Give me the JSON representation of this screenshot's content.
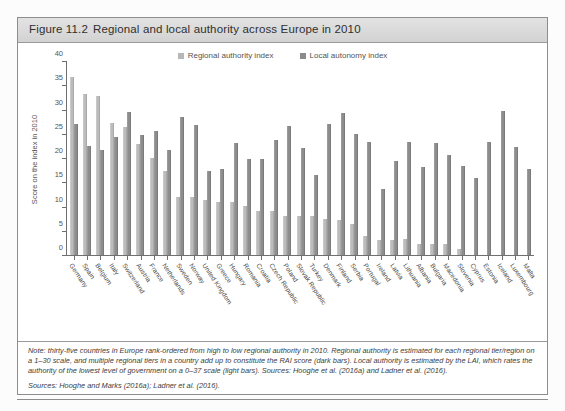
{
  "figure": {
    "number": "Figure 11.2",
    "title": "Regional and local authority across Europe in 2010"
  },
  "legend": {
    "items": [
      {
        "label": "Regional authority index",
        "color": "#b7b7b7",
        "key": "rai"
      },
      {
        "label": "Local autonomy index",
        "color": "#8b8b8b",
        "key": "lai"
      }
    ]
  },
  "notes": {
    "note": "Note: thirty-five countries in Europe rank-ordered from high to low regional authority in 2010. Regional authority is estimated for each regional tier/region on a 1–30 scale, and multiple regional tiers in a country add up to constitute the RAI score (dark bars). Local authority is estimated by the LAI, which rates the authority of the lowest level of government on a 0–37 scale (light bars). Sources: Hooghe et al. (2016a) and Ladner et al. (2016).",
    "sources": "Sources: Hooghe and Marks (2016a); Ladner et al. (2016)."
  },
  "chart_data": {
    "type": "bar",
    "title": "Regional and local authority across Europe in 2010",
    "xlabel": "",
    "ylabel": "Score on the index in 2010",
    "ylim": [
      0,
      40
    ],
    "yticks": [
      0,
      5,
      10,
      15,
      20,
      25,
      30,
      35,
      40
    ],
    "grid": false,
    "legend_position": "top-center",
    "categories": [
      "Germany",
      "Spain",
      "Belgium",
      "Italy",
      "Switzerland",
      "Austria",
      "France",
      "Netherlands",
      "Sweden",
      "Norway",
      "United Kingdom",
      "Greece",
      "Hungary",
      "Romania",
      "Croatia",
      "Czech Republic",
      "Poland",
      "Slovak Republic",
      "Turkey",
      "Denmark",
      "Finland",
      "Serbia",
      "Portugal",
      "Ireland",
      "Latvia",
      "Lithuania",
      "Albania",
      "Bulgaria",
      "Macedonia",
      "Slovenia",
      "Cyprus",
      "Estonia",
      "Iceland",
      "Luxembourg",
      "Malta"
    ],
    "series": [
      {
        "name": "Regional authority index",
        "color": "#bcbcbc",
        "values": [
          36.8,
          33.3,
          32.8,
          27.2,
          26.3,
          22.9,
          20.0,
          17.3,
          12.0,
          12.0,
          11.3,
          11.0,
          11.0,
          10.1,
          9.1,
          9.1,
          8.1,
          8.1,
          8.0,
          7.5,
          7.2,
          6.4,
          3.9,
          3.0,
          3.0,
          3.2,
          2.2,
          2.2,
          2.2,
          1.2,
          0,
          0,
          0,
          0,
          0
        ]
      },
      {
        "name": "Local autonomy index",
        "color": "#8d8d8d",
        "values": [
          27.0,
          22.5,
          21.6,
          24.3,
          29.4,
          24.8,
          25.5,
          21.7,
          28.5,
          26.9,
          17.4,
          17.8,
          23.0,
          19.8,
          19.9,
          23.7,
          26.6,
          22.0,
          16.6,
          27.0,
          29.3,
          25.0,
          23.4,
          13.7,
          19.3,
          23.4,
          18.1,
          23.1,
          20.7,
          18.4,
          15.9,
          23.3,
          29.7,
          22.3,
          17.8
        ]
      }
    ]
  }
}
